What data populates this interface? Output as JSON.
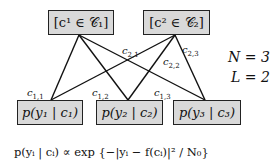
{
  "variable_nodes": [
    {
      "id": "c1",
      "label": "[c¹ ∈ 𝒞₁]"
    },
    {
      "id": "c2",
      "label": "[c² ∈ 𝒞₂]"
    }
  ],
  "factor_nodes": [
    {
      "id": "p1",
      "label": "p(y₁ | c₁)"
    },
    {
      "id": "p2",
      "label": "p(y₂ | c₂)"
    },
    {
      "id": "p3",
      "label": "p(y₃ | c₃)"
    }
  ],
  "edges": [
    {
      "from": "c1",
      "to": "p1",
      "label": "c1,1"
    },
    {
      "from": "c1",
      "to": "p2",
      "label": "c1,2"
    },
    {
      "from": "c1",
      "to": "p3",
      "label": "c1,3"
    },
    {
      "from": "c2",
      "to": "p1",
      "label": "c2,1"
    },
    {
      "from": "c2",
      "to": "p2",
      "label": "c2,2"
    },
    {
      "from": "c2",
      "to": "p3",
      "label": "c2,3"
    }
  ],
  "edge_labels": {
    "c11": {
      "base": "c",
      "sub": "1,1"
    },
    "c12": {
      "base": "c",
      "sub": "1,2"
    },
    "c13": {
      "base": "c",
      "sub": "1,3"
    },
    "c21": {
      "base": "c",
      "sub": "2,1"
    },
    "c22": {
      "base": "c",
      "sub": "2,2"
    },
    "c23": {
      "base": "c",
      "sub": "2,3"
    }
  },
  "params": {
    "n": "N = 3",
    "l": "L = 2"
  },
  "formula": "p(yᵢ | cᵢ) ∝ exp {−|yᵢ − f(cᵢ)|² / N₀}",
  "colors": {
    "box_fill": "#d9d9d9",
    "box_border": "#222222",
    "edge": "#111111"
  }
}
